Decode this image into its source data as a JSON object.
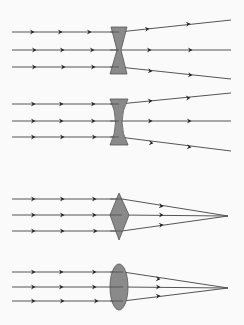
{
  "figure": {
    "width": 244,
    "height": 325,
    "background": "#fafafa",
    "ray_color": "#555555",
    "arrow_color": "#222222",
    "lens_fill": "#8a8a8a",
    "lens_stroke": "#555555"
  },
  "diagrams": [
    {
      "name": "diverging-lens-hourglass",
      "lens_type": "concave-hourglass",
      "lens_points": "111,27 127,27 121,50 127,74 110,74 117,50",
      "rays": [
        {
          "in_y": 32,
          "lens_x": 119,
          "out": [
            231,
            20
          ],
          "in_arrows": [
            32,
            60,
            89
          ],
          "out_arrows": [
            [
              147,
              29
            ],
            [
              188,
              24
            ]
          ]
        },
        {
          "in_y": 50,
          "lens_x": 119,
          "out": [
            231,
            50
          ],
          "in_arrows": [
            34,
            62,
            92
          ],
          "out_arrows": [
            [
              149,
              50
            ],
            [
              190,
              50
            ]
          ]
        },
        {
          "in_y": 67,
          "lens_x": 119,
          "out": [
            231,
            79
          ],
          "in_arrows": [
            34,
            63,
            93
          ],
          "out_arrows": [
            [
              150,
              71
            ],
            [
              190,
              75
            ]
          ]
        }
      ]
    },
    {
      "name": "diverging-lens-biconcave",
      "lens_type": "biconcave",
      "lens_path": "M110,99 L128,99 Q116,122 128,145 L110,145 Q121,122 110,99 Z",
      "rays": [
        {
          "in_y": 104,
          "lens_x": 119,
          "out": [
            231,
            93
          ],
          "in_arrows": [
            33,
            61,
            93
          ],
          "out_arrows": [
            [
              150,
              101
            ],
            [
              188,
              98
            ]
          ]
        },
        {
          "in_y": 121,
          "lens_x": 119,
          "out": [
            231,
            121
          ],
          "in_arrows": [
            33,
            61,
            93
          ],
          "out_arrows": [
            [
              150,
              121
            ],
            [
              189,
              121
            ]
          ]
        },
        {
          "in_y": 137,
          "lens_x": 119,
          "out": [
            231,
            151
          ],
          "in_arrows": [
            33,
            62,
            94
          ],
          "out_arrows": [
            [
              151,
              143
            ],
            [
              189,
              147
            ]
          ]
        }
      ]
    },
    {
      "name": "converging-lens-diamond",
      "lens_type": "diamond",
      "lens_points": "119,193 129,215 119,240 110,215",
      "focal_point": [
        228,
        216
      ],
      "rays": [
        {
          "in_y": 199,
          "lens_x": 122,
          "in_arrows": [
            33,
            62,
            94
          ],
          "out_arrows": [
            [
              161,
              206
            ]
          ]
        },
        {
          "in_y": 215,
          "lens_x": 122,
          "in_arrows": [
            33,
            62,
            94
          ],
          "out_arrows": [
            [
              161,
              215
            ]
          ]
        },
        {
          "in_y": 231,
          "lens_x": 122,
          "in_arrows": [
            33,
            62,
            95
          ],
          "out_arrows": [
            [
              161,
              225
            ]
          ]
        }
      ]
    },
    {
      "name": "converging-lens-biconvex",
      "lens_type": "biconvex",
      "lens_ellipse": {
        "cx": 119,
        "cy": 287,
        "rx": 9,
        "ry": 23
      },
      "focal_point": [
        228,
        288
      ],
      "rays": [
        {
          "in_y": 272,
          "lens_x": 123,
          "in_arrows": [
            33,
            61,
            94
          ],
          "out_arrows": [
            [
              158,
              279
            ]
          ]
        },
        {
          "in_y": 287,
          "lens_x": 123,
          "in_arrows": [
            33,
            61,
            94
          ],
          "out_arrows": [
            [
              158,
              287
            ]
          ]
        },
        {
          "in_y": 301,
          "lens_x": 123,
          "in_arrows": [
            33,
            62,
            96
          ],
          "out_arrows": [
            [
              158,
              296
            ]
          ]
        }
      ]
    }
  ]
}
